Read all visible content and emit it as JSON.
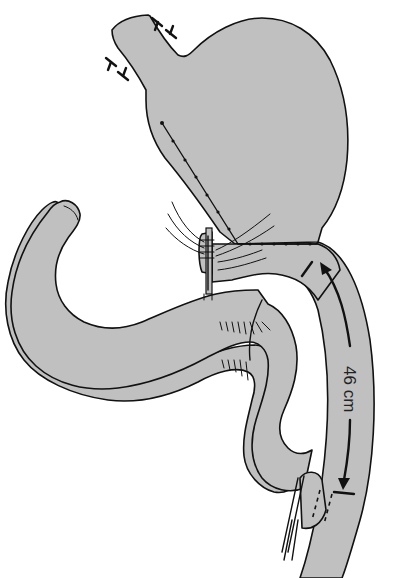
{
  "figure": {
    "type": "surgical-illustration",
    "measurement_label": "46 cm",
    "colors": {
      "organ_fill": "#c0c0c0",
      "outline": "#111111",
      "background": "#ffffff"
    }
  },
  "parts": {
    "stomach": "stomach",
    "esophagus": "esophagus-stump",
    "staple_line": "vertical-staple-line",
    "anastomosis_upper": "gastrojejunal-anastomosis",
    "roux_limb": "roux-limb",
    "bowel_loop": "jejunal-loop",
    "anastomosis_lower": "jejunojejunal-anastomosis",
    "stapler_upper": "linear-stapler-upper",
    "stapler_lower": "linear-stapler-lower"
  }
}
